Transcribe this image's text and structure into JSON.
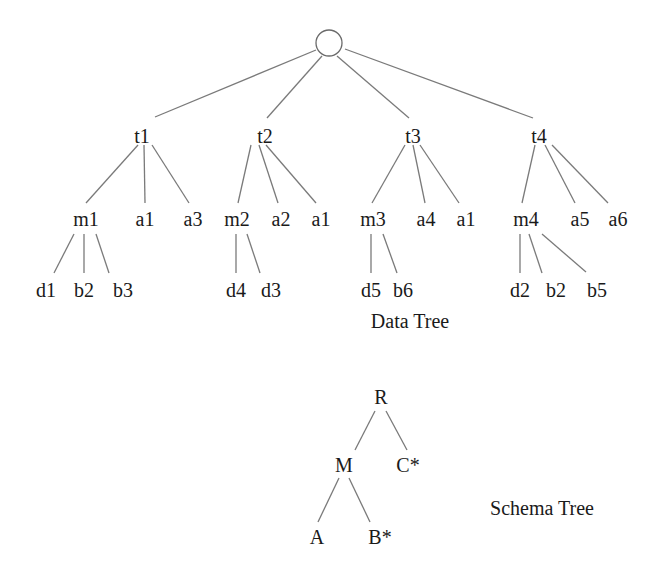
{
  "data_tree": {
    "caption": "Data Tree",
    "root": {
      "label": ""
    },
    "level1": [
      {
        "label": "t1"
      },
      {
        "label": "t2"
      },
      {
        "label": "t3"
      },
      {
        "label": "t4"
      }
    ],
    "level2": [
      {
        "label": "m1",
        "parent": "t1"
      },
      {
        "label": "a1",
        "parent": "t1"
      },
      {
        "label": "a3",
        "parent": "t1"
      },
      {
        "label": "m2",
        "parent": "t2"
      },
      {
        "label": "a2",
        "parent": "t2"
      },
      {
        "label": "a1",
        "parent": "t2"
      },
      {
        "label": "m3",
        "parent": "t3"
      },
      {
        "label": "a4",
        "parent": "t3"
      },
      {
        "label": "a1",
        "parent": "t3"
      },
      {
        "label": "m4",
        "parent": "t4"
      },
      {
        "label": "a5",
        "parent": "t4"
      },
      {
        "label": "a6",
        "parent": "t4"
      }
    ],
    "level3": [
      {
        "label": "d1",
        "parent": "m1"
      },
      {
        "label": "b2",
        "parent": "m1"
      },
      {
        "label": "b3",
        "parent": "m1"
      },
      {
        "label": "d4",
        "parent": "m2"
      },
      {
        "label": "d3",
        "parent": "m2"
      },
      {
        "label": "d5",
        "parent": "m3"
      },
      {
        "label": "b6",
        "parent": "m3"
      },
      {
        "label": "d2",
        "parent": "m4"
      },
      {
        "label": "b2",
        "parent": "m4"
      },
      {
        "label": "b5",
        "parent": "m4"
      }
    ]
  },
  "schema_tree": {
    "caption": "Schema Tree",
    "root": {
      "label": "R"
    },
    "level1": [
      {
        "label": "M",
        "parent": "R"
      },
      {
        "label": "C*",
        "parent": "R"
      }
    ],
    "level2": [
      {
        "label": "A",
        "parent": "M"
      },
      {
        "label": "B*",
        "parent": "M"
      }
    ]
  },
  "colors": {
    "edge": "#7a7a7a",
    "text": "#1a1a1a",
    "background": "#ffffff"
  }
}
